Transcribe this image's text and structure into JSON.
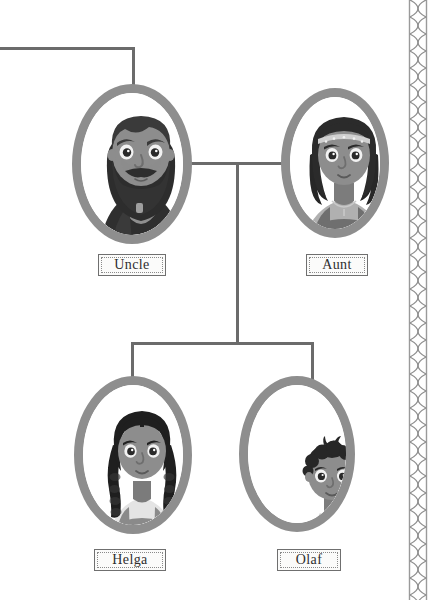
{
  "illustration": {
    "title": "Family tree branch",
    "style": "grayscale storybook illustration",
    "background_color": "#ffffff",
    "line_color": "#6b6b6b",
    "frame_color": "#8e8e8e"
  },
  "nodes": [
    {
      "id": "uncle",
      "label": "Uncle",
      "description": "bearded man with long dark beard and dark tunic",
      "skin": "#8d8d8d",
      "hair": "#3a3a3a",
      "garment": "#2e2e2e",
      "x": 72,
      "y": 84,
      "width": 120,
      "height": 160
    },
    {
      "id": "aunt",
      "label": "Aunt",
      "description": "woman with curly dark hair, beaded headband and pinafore dress",
      "skin": "#8d8d8d",
      "hair": "#2b2b2b",
      "garment": "#777777",
      "x": 281,
      "y": 88,
      "width": 108,
      "height": 150
    },
    {
      "id": "helga",
      "label": "Helga",
      "description": "girl with two long braids wearing a pinafore",
      "skin": "#8d8d8d",
      "hair": "#1f1f1f",
      "garment": "#8a8a8a",
      "x": 74,
      "y": 376,
      "width": 118,
      "height": 158
    },
    {
      "id": "olaf",
      "label": "Olaf",
      "description": "small boy with curly dark hair in a light shirt",
      "skin": "#8d8d8d",
      "hair": "#272727",
      "garment": "#b9b9b9",
      "x": 239,
      "y": 376,
      "width": 116,
      "height": 156
    }
  ],
  "plaques": [
    {
      "id": "plaque-uncle",
      "label": "Uncle",
      "x": 98,
      "y": 254,
      "width": 68,
      "height": 22
    },
    {
      "id": "plaque-aunt",
      "label": "Aunt",
      "x": 306,
      "y": 254,
      "width": 62,
      "height": 22
    },
    {
      "id": "plaque-helga",
      "label": "Helga",
      "x": 94,
      "y": 549,
      "width": 72,
      "height": 22
    },
    {
      "id": "plaque-olaf",
      "label": "Olaf",
      "x": 277,
      "y": 549,
      "width": 64,
      "height": 22
    }
  ],
  "connectors": [
    {
      "id": "top-horizontal",
      "orientation": "horizontal",
      "x": 0,
      "y": 47,
      "length": 135,
      "thickness": 3
    },
    {
      "id": "uncle-drop",
      "orientation": "vertical",
      "x": 132,
      "y": 47,
      "length": 42,
      "thickness": 3
    },
    {
      "id": "spouse-horizontal",
      "orientation": "horizontal",
      "x": 180,
      "y": 162,
      "length": 122,
      "thickness": 3
    },
    {
      "id": "children-drop",
      "orientation": "vertical",
      "x": 236,
      "y": 162,
      "length": 182,
      "thickness": 3
    },
    {
      "id": "children-bar",
      "orientation": "horizontal",
      "x": 131,
      "y": 342,
      "length": 183,
      "thickness": 3
    },
    {
      "id": "helga-drop",
      "orientation": "vertical",
      "x": 131,
      "y": 342,
      "length": 40,
      "thickness": 3
    },
    {
      "id": "olaf-drop",
      "orientation": "vertical",
      "x": 311,
      "y": 342,
      "length": 40,
      "thickness": 3
    }
  ],
  "border": {
    "id": "braided-border",
    "position": "right",
    "pattern": "braided rope twist",
    "width": 24,
    "color": "#9a9a9a"
  }
}
